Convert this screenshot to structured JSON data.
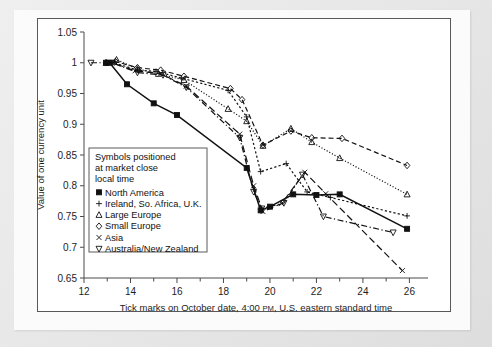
{
  "figure": {
    "background_color": "#e8e8e8",
    "panel_color": "#ffffff"
  },
  "chart_data": {
    "type": "line",
    "title": "",
    "subtitle": "",
    "xlabel": "Tick marks on October date, 4:00 PM, U.S. eastern standard time",
    "xlabel_parts": {
      "before": "Tick marks on October date, 4:00 ",
      "smallcaps": "PM",
      "after": ", U.S. eastern standard time"
    },
    "ylabel": "Value of one currency unit",
    "xlim": [
      12,
      26.8
    ],
    "ylim": [
      0.65,
      1.05
    ],
    "xticks": [
      12,
      14,
      16,
      18,
      20,
      22,
      24,
      26
    ],
    "xticklabels": [
      "12",
      "14",
      "16",
      "18",
      "20",
      "22",
      "24",
      "26"
    ],
    "xminorticks": [
      13,
      15,
      17,
      19,
      21,
      23,
      25
    ],
    "yticks": [
      0.65,
      0.7,
      0.75,
      0.8,
      0.85,
      0.9,
      0.95,
      1,
      1.05
    ],
    "yticklabels": [
      "0.65",
      "0.7",
      "0.75",
      "0.8",
      "0.85",
      "0.9",
      "0.95",
      "1",
      "1.05"
    ],
    "grid": false,
    "legend_position": "inside-lower-left",
    "series": [
      {
        "name": "North America",
        "marker": "filled-square",
        "linestyle": "solid",
        "points": [
          [
            12.95,
            1.0
          ],
          [
            13.1,
            1.0
          ],
          [
            13.85,
            0.965
          ],
          [
            15.0,
            0.934
          ],
          [
            16.0,
            0.915
          ],
          [
            19.0,
            0.829
          ],
          [
            19.6,
            0.76
          ],
          [
            20.0,
            0.766
          ],
          [
            21.0,
            0.786
          ],
          [
            22.0,
            0.785
          ],
          [
            23.0,
            0.786
          ],
          [
            25.9,
            0.73
          ]
        ]
      },
      {
        "name": "Ireland, So. Africa, U.K.",
        "marker": "plus",
        "linestyle": "dotted",
        "points": [
          [
            12.95,
            1.0
          ],
          [
            13.3,
            1.0
          ],
          [
            14.3,
            0.988
          ],
          [
            15.1,
            0.986
          ],
          [
            16.2,
            0.975
          ],
          [
            18.2,
            0.955
          ],
          [
            19.0,
            0.912
          ],
          [
            19.6,
            0.823
          ],
          [
            20.7,
            0.836
          ],
          [
            21.6,
            0.79
          ],
          [
            22.6,
            0.781
          ],
          [
            25.9,
            0.751
          ]
        ]
      },
      {
        "name": "Large Europe",
        "marker": "open-triangle-up",
        "linestyle": "dotted-fine",
        "points": [
          [
            12.95,
            1.0
          ],
          [
            13.4,
            1.005
          ],
          [
            14.3,
            0.99
          ],
          [
            15.2,
            0.982
          ],
          [
            16.3,
            0.972
          ],
          [
            18.2,
            0.925
          ],
          [
            19.0,
            0.905
          ],
          [
            19.7,
            0.865
          ],
          [
            20.9,
            0.893
          ],
          [
            21.8,
            0.871
          ],
          [
            23.0,
            0.845
          ],
          [
            25.9,
            0.786
          ]
        ]
      },
      {
        "name": "Small Europe",
        "marker": "open-diamond",
        "linestyle": "dashed",
        "points": [
          [
            12.95,
            1.0
          ],
          [
            13.35,
            1.002
          ],
          [
            14.3,
            0.992
          ],
          [
            15.3,
            0.988
          ],
          [
            16.3,
            0.978
          ],
          [
            18.3,
            0.958
          ],
          [
            18.8,
            0.94
          ],
          [
            19.7,
            0.866
          ],
          [
            20.9,
            0.889
          ],
          [
            21.8,
            0.878
          ],
          [
            23.1,
            0.877
          ],
          [
            25.9,
            0.833
          ]
        ]
      },
      {
        "name": "Asia",
        "marker": "x-cross",
        "linestyle": "dashed-long",
        "points": [
          [
            12.95,
            1.0
          ],
          [
            13.2,
            1.0
          ],
          [
            14.2,
            0.987
          ],
          [
            15.3,
            0.982
          ],
          [
            16.4,
            0.962
          ],
          [
            18.7,
            0.884
          ],
          [
            19.3,
            0.8
          ],
          [
            19.7,
            0.758
          ],
          [
            20.5,
            0.771
          ],
          [
            21.5,
            0.822
          ],
          [
            22.4,
            0.787
          ],
          [
            25.7,
            0.662
          ]
        ]
      },
      {
        "name": "Australia/New Zealand",
        "marker": "open-triangle-down",
        "linestyle": "dash-dot",
        "points": [
          [
            12.3,
            1.0
          ],
          [
            13.2,
            1.0
          ],
          [
            14.3,
            0.984
          ],
          [
            15.4,
            0.98
          ],
          [
            16.4,
            0.96
          ],
          [
            18.7,
            0.878
          ],
          [
            19.3,
            0.79
          ],
          [
            19.65,
            0.763
          ],
          [
            20.6,
            0.772
          ],
          [
            21.4,
            0.818
          ],
          [
            22.3,
            0.75
          ],
          [
            25.3,
            0.724
          ]
        ]
      }
    ],
    "legend": {
      "note_lines": [
        "Symbols positioned",
        "at market close",
        "local time"
      ],
      "entries": [
        {
          "symbol": "filled-square",
          "label": "North America"
        },
        {
          "symbol": "plus",
          "label": "Ireland, So. Africa, U.K."
        },
        {
          "symbol": "open-triangle-up",
          "label": "Large Europe"
        },
        {
          "symbol": "open-diamond",
          "label": "Small Europe"
        },
        {
          "symbol": "x-cross",
          "label": "Asia"
        },
        {
          "symbol": "open-triangle-down",
          "label": "Australia/New Zealand"
        }
      ]
    }
  }
}
